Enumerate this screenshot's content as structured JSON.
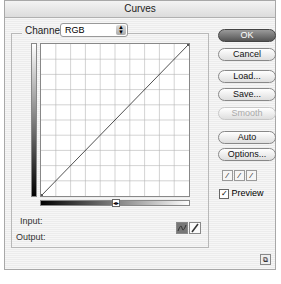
{
  "window": {
    "title": "Curves"
  },
  "channel": {
    "label": "Channel:",
    "value": "RGB"
  },
  "graph": {
    "grid_divisions": 10,
    "curve": [
      [
        0,
        0
      ],
      [
        255,
        255
      ]
    ]
  },
  "readouts": {
    "input_label": "Input:",
    "output_label": "Output:"
  },
  "buttons": {
    "ok": "OK",
    "cancel": "Cancel",
    "load": "Load...",
    "save": "Save...",
    "smooth": "Smooth",
    "auto": "Auto",
    "options": "Options..."
  },
  "preview": {
    "label": "Preview",
    "checked": true
  },
  "icons": {
    "curve_mode": "curve-tool-icon",
    "pencil_mode": "pencil-tool-icon",
    "eyedroppers": [
      "black-eyedropper-icon",
      "gray-eyedropper-icon",
      "white-eyedropper-icon"
    ],
    "resize": "expand-icon"
  }
}
